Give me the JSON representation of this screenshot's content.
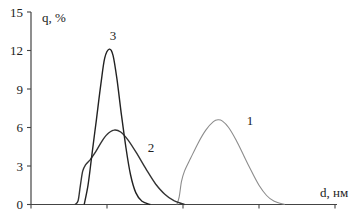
{
  "chart_data": {
    "type": "line",
    "title": "",
    "xlabel": "d, нм",
    "ylabel": "q, %",
    "ylim": [
      0,
      15
    ],
    "yticks": [
      0,
      3,
      6,
      9,
      12,
      15
    ],
    "y_tick_labels": [
      "0",
      "3",
      "6",
      "9",
      "12",
      "15"
    ],
    "xlim": [
      0,
      4
    ],
    "xticks": [
      0,
      1,
      2,
      3,
      4
    ],
    "x_tick_labels": [
      "",
      "",
      "",
      "",
      ""
    ],
    "grid": false,
    "legend": "inline curve numbers",
    "series": [
      {
        "name": "1",
        "label": "1",
        "color": "#8c8c8c",
        "label_at": [
          2.88,
          6.2
        ],
        "points": [
          [
            1.92,
            0
          ],
          [
            1.95,
            0.6
          ],
          [
            1.98,
            1.8
          ],
          [
            2.02,
            2.6
          ],
          [
            2.1,
            3.6
          ],
          [
            2.2,
            4.8
          ],
          [
            2.3,
            5.8
          ],
          [
            2.4,
            6.45
          ],
          [
            2.46,
            6.6
          ],
          [
            2.52,
            6.5
          ],
          [
            2.6,
            6.0
          ],
          [
            2.7,
            5.0
          ],
          [
            2.8,
            3.8
          ],
          [
            2.9,
            2.6
          ],
          [
            3.0,
            1.5
          ],
          [
            3.1,
            0.7
          ],
          [
            3.2,
            0.25
          ],
          [
            3.34,
            0
          ]
        ]
      },
      {
        "name": "2",
        "label": "2",
        "color": "#333333",
        "label_at": [
          1.58,
          4.1
        ],
        "points": [
          [
            0.58,
            0
          ],
          [
            0.62,
            0.3
          ],
          [
            0.65,
            1.5
          ],
          [
            0.68,
            2.6
          ],
          [
            0.72,
            3.1
          ],
          [
            0.78,
            3.5
          ],
          [
            0.85,
            4.1
          ],
          [
            0.92,
            4.8
          ],
          [
            1.0,
            5.45
          ],
          [
            1.09,
            5.8
          ],
          [
            1.18,
            5.65
          ],
          [
            1.28,
            5.0
          ],
          [
            1.4,
            3.9
          ],
          [
            1.52,
            2.7
          ],
          [
            1.64,
            1.6
          ],
          [
            1.76,
            0.8
          ],
          [
            1.88,
            0.3
          ],
          [
            2.02,
            0
          ]
        ]
      },
      {
        "name": "3",
        "label": "3",
        "color": "#222222",
        "label_at": [
          1.08,
          12.8
        ],
        "points": [
          [
            0.7,
            0
          ],
          [
            0.75,
            1.5
          ],
          [
            0.8,
            3.8
          ],
          [
            0.86,
            6.6
          ],
          [
            0.92,
            9.4
          ],
          [
            0.97,
            11.4
          ],
          [
            1.03,
            12.1
          ],
          [
            1.08,
            11.6
          ],
          [
            1.13,
            9.8
          ],
          [
            1.19,
            7.0
          ],
          [
            1.25,
            4.4
          ],
          [
            1.31,
            2.3
          ],
          [
            1.38,
            0.9
          ],
          [
            1.46,
            0.25
          ],
          [
            1.57,
            0
          ]
        ]
      }
    ]
  }
}
